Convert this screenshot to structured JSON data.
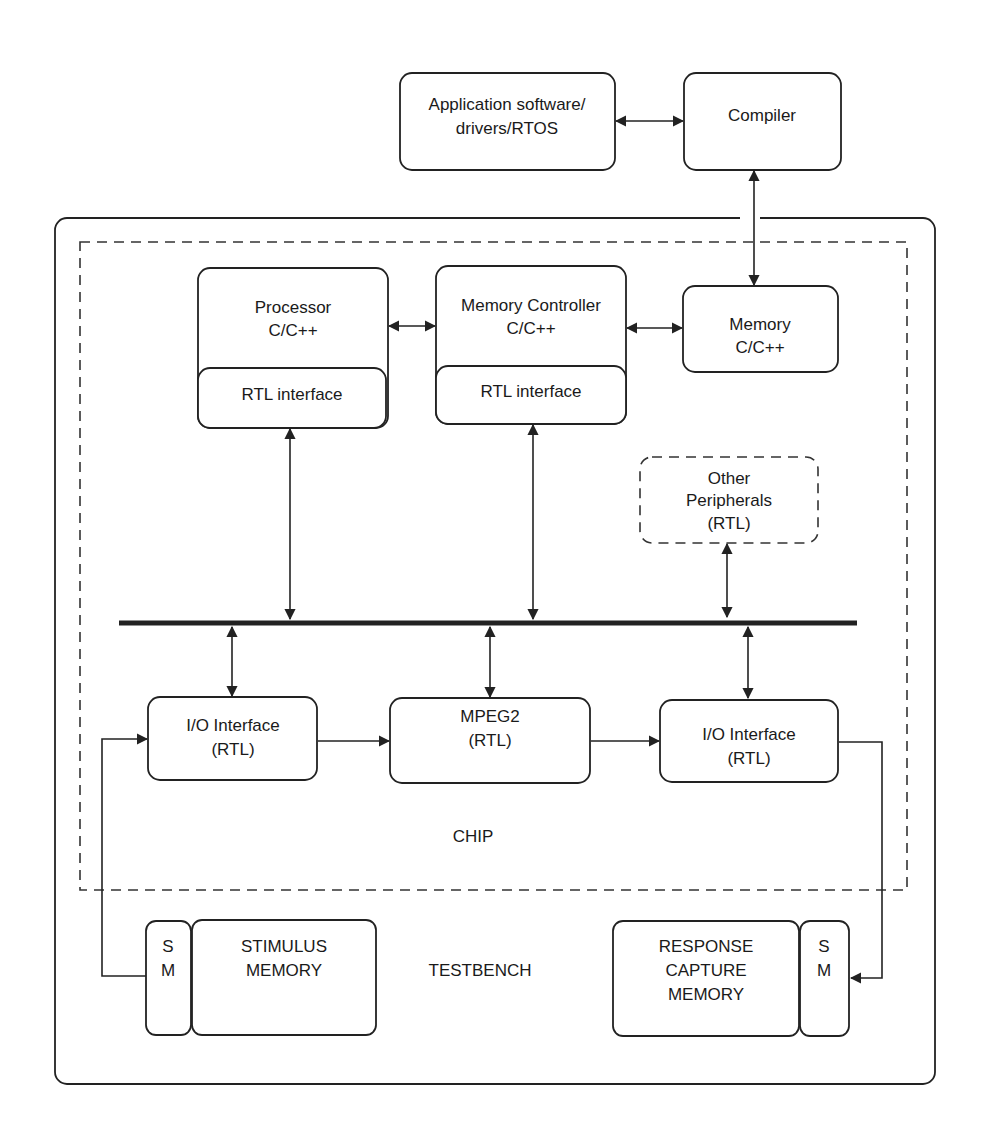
{
  "diagram": {
    "type": "block-diagram",
    "top": {
      "app_software": {
        "line1": "Application software/",
        "line2": "drivers/RTOS"
      },
      "compiler": {
        "label": "Compiler"
      }
    },
    "chip": {
      "label": "CHIP",
      "processor": {
        "line1": "Processor",
        "line2": "C/C++",
        "interface": "RTL interface"
      },
      "memory_controller": {
        "line1": "Memory Controller",
        "line2": "C/C++",
        "interface": "RTL interface"
      },
      "memory": {
        "line1": "Memory",
        "line2": "C/C++"
      },
      "other_peripherals": {
        "line1": "Other",
        "line2": "Peripherals",
        "line3": "(RTL)"
      },
      "io_in": {
        "line1": "I/O Interface",
        "line2": "(RTL)"
      },
      "mpeg2": {
        "line1": "MPEG2",
        "line2": "(RTL)"
      },
      "io_out": {
        "line1": "I/O Interface",
        "line2": "(RTL)"
      }
    },
    "testbench": {
      "label": "TESTBENCH",
      "stimulus": {
        "sm_s": "S",
        "sm_m": "M",
        "line1": "STIMULUS",
        "line2": "MEMORY"
      },
      "response": {
        "sm_s": "S",
        "sm_m": "M",
        "line1": "RESPONSE",
        "line2": "CAPTURE",
        "line3": "MEMORY"
      }
    },
    "connections": [
      "Application software <-> Compiler",
      "Compiler <-> Memory",
      "Processor <-> Memory Controller",
      "Memory Controller <-> Memory",
      "Processor RTL interface <-> Bus",
      "Memory Controller RTL interface <-> Bus",
      "Other Peripherals <-> Bus",
      "Bus <-> I/O Interface (in)",
      "Bus <-> MPEG2",
      "Bus <-> I/O Interface (out)",
      "Stimulus SM -> I/O Interface (in)",
      "I/O Interface (in) -> MPEG2",
      "MPEG2 -> I/O Interface (out)",
      "I/O Interface (out) -> Response SM"
    ]
  }
}
